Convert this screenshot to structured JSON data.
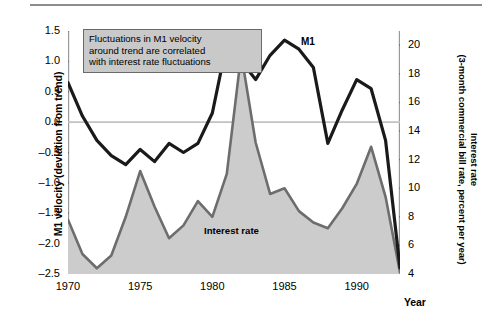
{
  "figure": {
    "x_axis_title": "Year",
    "left_axis_title": "M1 velocity (deviation from trend)",
    "right_axis_title_line1": "Interest rate",
    "right_axis_title_line2": "(3-month commercial bill rate, percent per year)",
    "annotation": {
      "line1": "Fluctuations in M1 velocity",
      "line2": "around trend are correlated",
      "line3": "with interest rate fluctuations",
      "fill_color": "#c9c9c9",
      "border_color": "#6a6a6a"
    },
    "m1_label": "M1",
    "interest_rate_label": "Interest rate"
  },
  "chart_data": {
    "type": "line",
    "title": "",
    "xlabel": "Year",
    "grid": false,
    "zero_line": true,
    "legend_position": "inline-annotations",
    "x_axis": {
      "label": "Year",
      "range": [
        1970,
        1993
      ],
      "tick_labels": [
        "1970",
        "1975",
        "1980",
        "1985",
        "1990"
      ],
      "ticks": [
        1970,
        1975,
        1980,
        1985,
        1990
      ],
      "minor_tick_step": 1
    },
    "y_axis_left": {
      "label": "M1 velocity (deviation from trend)",
      "range": [
        -2.5,
        1.5
      ],
      "tick_labels": [
        "1.5",
        "1.0",
        "0.5",
        "0.0",
        "-0.5",
        "-1.0",
        "-1.5",
        "-2.0",
        "-2.5"
      ],
      "ticks": [
        1.5,
        1.0,
        0.5,
        0.0,
        -0.5,
        -1.0,
        -1.5,
        -2.0,
        -2.5
      ]
    },
    "y_axis_right": {
      "label": "Interest rate (3-month commercial bill rate, percent per year)",
      "range": [
        4,
        21
      ],
      "tick_labels": [
        "20",
        "18",
        "16",
        "14",
        "12",
        "10",
        "8",
        "6",
        "4"
      ],
      "ticks": [
        20,
        18,
        16,
        14,
        12,
        10,
        8,
        6,
        4
      ]
    },
    "series": [
      {
        "name": "M1 velocity (deviation from trend)",
        "axis": "left",
        "type": "line",
        "color": "#1a1a1a",
        "line_width": 3.2,
        "x": [
          1970,
          1971,
          1972,
          1973,
          1974,
          1975,
          1976,
          1977,
          1978,
          1979,
          1980,
          1981,
          1982,
          1983,
          1984,
          1985,
          1986,
          1987,
          1988,
          1989,
          1990,
          1991,
          1992,
          1993
        ],
        "values": [
          0.65,
          0.1,
          -0.3,
          -0.55,
          -0.7,
          -0.45,
          -0.65,
          -0.35,
          -0.5,
          -0.35,
          0.15,
          1.3,
          1.0,
          0.7,
          1.1,
          1.35,
          1.2,
          0.9,
          -0.35,
          0.2,
          0.7,
          0.55,
          -0.3,
          -2.4
        ]
      },
      {
        "name": "Interest rate (3-month commercial bill rate)",
        "axis": "right",
        "type": "area",
        "color": "#6d6d6d",
        "fill_color": "#cccccc",
        "line_width": 2.6,
        "x": [
          1970,
          1971,
          1972,
          1973,
          1974,
          1975,
          1976,
          1977,
          1978,
          1979,
          1980,
          1981,
          1982,
          1983,
          1984,
          1985,
          1986,
          1987,
          1988,
          1989,
          1990,
          1991,
          1992,
          1993
        ],
        "values": [
          7.8,
          5.4,
          4.4,
          5.3,
          8.0,
          11.2,
          8.7,
          6.5,
          7.4,
          9.1,
          8.0,
          11.0,
          19.4,
          13.2,
          9.6,
          10.0,
          8.4,
          7.6,
          7.2,
          8.6,
          10.3,
          12.9,
          9.4,
          4.1
        ]
      }
    ]
  }
}
